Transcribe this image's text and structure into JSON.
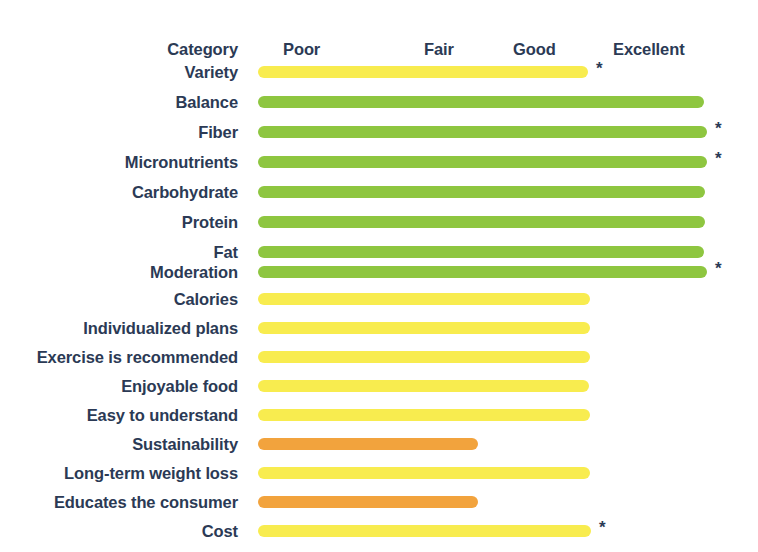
{
  "chart_data": {
    "type": "bar",
    "title": "",
    "subtitle": "",
    "xlabel": "",
    "ylabel": "Category",
    "orientation": "horizontal",
    "grid": false,
    "legend_position": "none",
    "scale_labels": [
      "Poor",
      "Fair",
      "Good",
      "Excellent"
    ],
    "scale_positions_px": [
      307,
      447,
      537,
      651
    ],
    "xlim": [
      0,
      4
    ],
    "bar_start_px": 258,
    "colors": {
      "green": "#8ec640",
      "yellow": "#f8ec4f",
      "orange": "#f2a33d",
      "text": "#2b3a55",
      "background": "#ffffff"
    },
    "categories": [
      "Variety",
      "Balance",
      "Fiber",
      "Micronutrients",
      "Carbohydrate",
      "Protein",
      "Fat",
      "Moderation",
      "Calories",
      "Individualized plans",
      "Exercise is recommended",
      "Enjoyable food",
      "Easy to understand",
      "Sustainability",
      "Long-term weight loss",
      "Educates the consumer",
      "Cost"
    ],
    "values": [
      2.96,
      3.98,
      4.0,
      4.0,
      3.99,
      3.99,
      3.98,
      4.0,
      2.98,
      2.98,
      2.98,
      2.97,
      2.98,
      1.96,
      2.98,
      1.96,
      2.99
    ],
    "ratings": [
      "Good",
      "Excellent",
      "Excellent",
      "Excellent",
      "Excellent",
      "Excellent",
      "Excellent",
      "Excellent",
      "Good",
      "Good",
      "Good",
      "Good",
      "Good",
      "Fair",
      "Good",
      "Fair",
      "Good"
    ],
    "annotations": {
      "asterisk_symbol": "*",
      "asterisk_rows": [
        "Variety",
        "Fiber",
        "Micronutrients",
        "Moderation",
        "Cost"
      ]
    }
  },
  "header": {
    "category_label": "Category",
    "poor_label": "Poor",
    "fair_label": "Fair",
    "good_label": "Good",
    "excellent_label": "Excellent"
  },
  "rows": [
    {
      "label": "Variety",
      "color": "#f8ec4f",
      "width_px": 330,
      "star": "*",
      "top": 62
    },
    {
      "label": "Balance",
      "color": "#8ec640",
      "width_px": 446,
      "star": "",
      "top": 92
    },
    {
      "label": "Fiber",
      "color": "#8ec640",
      "width_px": 449,
      "star": "*",
      "top": 122
    },
    {
      "label": "Micronutrients",
      "color": "#8ec640",
      "width_px": 449,
      "star": "*",
      "top": 152
    },
    {
      "label": "Carbohydrate",
      "color": "#8ec640",
      "width_px": 447,
      "star": "",
      "top": 182
    },
    {
      "label": "Protein",
      "color": "#8ec640",
      "width_px": 447,
      "star": "",
      "top": 212
    },
    {
      "label": "Fat",
      "color": "#8ec640",
      "width_px": 446,
      "star": "",
      "top": 242
    },
    {
      "label": "Moderation",
      "color": "#8ec640",
      "width_px": 449,
      "star": "*",
      "top": 262
    },
    {
      "label": "Calories",
      "color": "#f8ec4f",
      "width_px": 332,
      "star": "",
      "top": 289
    },
    {
      "label": "Individualized plans",
      "color": "#f8ec4f",
      "width_px": 332,
      "star": "",
      "top": 318
    },
    {
      "label": "Exercise is recommended",
      "color": "#f8ec4f",
      "width_px": 332,
      "star": "",
      "top": 347
    },
    {
      "label": "Enjoyable food",
      "color": "#f8ec4f",
      "width_px": 331,
      "star": "",
      "top": 376
    },
    {
      "label": "Easy to understand",
      "color": "#f8ec4f",
      "width_px": 332,
      "star": "",
      "top": 405
    },
    {
      "label": "Sustainability",
      "color": "#f2a33d",
      "width_px": 220,
      "star": "",
      "top": 434
    },
    {
      "label": "Long-term weight loss",
      "color": "#f8ec4f",
      "width_px": 332,
      "star": "",
      "top": 463
    },
    {
      "label": "Educates the consumer",
      "color": "#f2a33d",
      "width_px": 220,
      "star": "",
      "top": 492
    },
    {
      "label": "Cost",
      "color": "#f8ec4f",
      "width_px": 333,
      "star": "*",
      "top": 521
    }
  ]
}
